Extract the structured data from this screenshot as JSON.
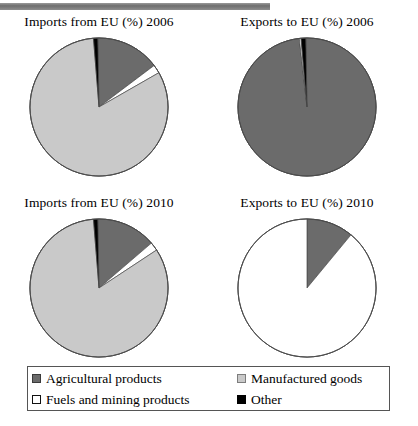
{
  "figure": {
    "top_rule": true,
    "colors": {
      "agricultural": "#6b6b6b",
      "manufactured": "#c9c9c9",
      "fuels": "#ffffff",
      "other": "#000000",
      "outline": "#4a4a4a"
    }
  },
  "legend": {
    "items": [
      {
        "label": "Agricultural products",
        "swatch": "agricultural",
        "icon": "square-swatch-icon"
      },
      {
        "label": "Manufactured goods",
        "swatch": "manufactured",
        "icon": "square-swatch-icon"
      },
      {
        "label": "Fuels and mining products",
        "swatch": "fuels",
        "icon": "square-swatch-icon"
      },
      {
        "label": "Other",
        "swatch": "other",
        "icon": "square-swatch-icon"
      }
    ]
  },
  "charts": [
    {
      "id": "imports-2006",
      "title": "Imports from EU (%) 2006",
      "position": "top-left"
    },
    {
      "id": "exports-2006",
      "title": "Exports to EU (%) 2006",
      "position": "top-right"
    },
    {
      "id": "imports-2010",
      "title": "Imports from EU (%) 2010",
      "position": "bottom-left"
    },
    {
      "id": "exports-2010",
      "title": "Exports to EU (%) 2010",
      "position": "bottom-right"
    }
  ],
  "chart_data": [
    {
      "type": "pie",
      "title": "Imports from EU (%) 2006",
      "categories": [
        "Agricultural products",
        "Fuels and mining products",
        "Manufactured goods",
        "Other"
      ],
      "values": [
        15,
        2,
        82,
        1
      ],
      "start_angle": -1,
      "legend_position": "bottom",
      "grid": false
    },
    {
      "type": "pie",
      "title": "Exports to EU (%) 2006",
      "categories": [
        "Agricultural products",
        "Fuels and mining products",
        "Manufactured goods",
        "Other"
      ],
      "values": [
        98.5,
        0.4,
        0,
        1.1
      ],
      "start_angle": -1,
      "legend_position": "bottom",
      "grid": false
    },
    {
      "type": "pie",
      "title": "Imports from EU (%) 2010",
      "categories": [
        "Agricultural products",
        "Fuels and mining products",
        "Manufactured goods",
        "Other"
      ],
      "values": [
        14,
        2,
        83,
        1
      ],
      "start_angle": -1,
      "legend_position": "bottom",
      "grid": false
    },
    {
      "type": "pie",
      "title": "Exports to EU (%) 2010",
      "categories": [
        "Agricultural products",
        "Fuels and mining products",
        "Manufactured goods",
        "Other"
      ],
      "values": [
        11,
        89,
        0,
        0
      ],
      "start_angle": 0,
      "legend_position": "bottom",
      "grid": false
    }
  ]
}
